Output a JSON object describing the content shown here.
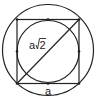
{
  "diagram": {
    "labels": {
      "diagonal": "a√2",
      "diagonal_prefix": "a",
      "diagonal_radicand": "2",
      "side": "a"
    },
    "colors": {
      "stroke": "#222222",
      "background": "#ffffff"
    }
  }
}
